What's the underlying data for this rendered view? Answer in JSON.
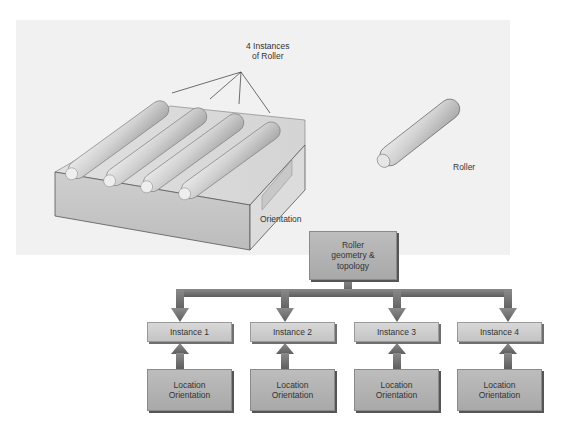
{
  "figure": {
    "illustration": {
      "instances_callout": "4 Instances\nof Roller",
      "assembly_label": "Orientation",
      "single_part_label": "Roller"
    },
    "hierarchy": {
      "root": {
        "label": "Roller\ngeometry &\ntopology"
      },
      "instances": [
        {
          "label": "Instance 1",
          "transform": "Location\nOrientation"
        },
        {
          "label": "Instance 2",
          "transform": "Location\nOrientation"
        },
        {
          "label": "Instance 3",
          "transform": "Location\nOrientation"
        },
        {
          "label": "Instance 4",
          "transform": "Location\nOrientation"
        }
      ]
    },
    "colors": {
      "panel_bg": "#f1f1f1",
      "box_light": "#d0d0d0",
      "box_dark": "#b3b3b3",
      "connector": "#6e6e6e",
      "part_gray": "#c9c9c9"
    }
  }
}
